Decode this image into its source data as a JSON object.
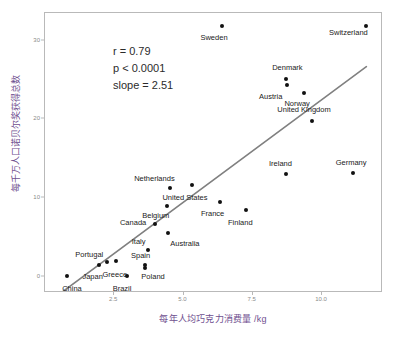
{
  "chart_data": {
    "type": "scatter",
    "title": "",
    "xlabel": "每年人均巧克力消费量 /kg",
    "ylabel": "每千万人口诺贝尔奖获得总数",
    "xlim": [
      0,
      12.2
    ],
    "ylim": [
      -2.0,
      33.5
    ],
    "xticks": [
      "2.5",
      "5.0",
      "7.5",
      "10.0"
    ],
    "xtick_values": [
      2.5,
      5.0,
      7.5,
      10.0
    ],
    "yticks": [
      "0",
      "10",
      "20",
      "30"
    ],
    "ytick_values": [
      0,
      10,
      20,
      30
    ],
    "grid": false,
    "legend": "none",
    "annotations": {
      "r": "r = 0.79",
      "p": "p < 0.0001",
      "slope": "slope = 2.51"
    },
    "stats": {
      "correlation": 0.79,
      "p_value": "< 0.0001",
      "slope": 2.51
    },
    "fit_line": {
      "type": "linear",
      "color": "#808080",
      "x_start": 0.65,
      "y_start": -1.8,
      "x_end": 11.6,
      "y_end": 26.7
    },
    "point_color": "#111111",
    "points": [
      {
        "name": "China",
        "x": 0.8,
        "y": 0.1,
        "lx": 0.62,
        "ly": -1.35,
        "anchor": "left"
      },
      {
        "name": "Japan",
        "x": 1.95,
        "y": 1.6,
        "lx": 1.72,
        "ly": 0.1,
        "anchor": "center"
      },
      {
        "name": "Portugal",
        "x": 2.22,
        "y": 1.95,
        "lx": 1.6,
        "ly": 2.95,
        "anchor": "center"
      },
      {
        "name": "Brazil",
        "x": 2.95,
        "y": 0.15,
        "lx": 2.78,
        "ly": -1.35,
        "anchor": "center"
      },
      {
        "name": "Greece",
        "x": 2.55,
        "y": 2.05,
        "lx": 2.52,
        "ly": 0.45,
        "anchor": "center"
      },
      {
        "name": "Spain",
        "x": 3.6,
        "y": 1.6,
        "lx": 3.45,
        "ly": 2.85,
        "anchor": "center"
      },
      {
        "name": "Poland",
        "x": 3.62,
        "y": 1.2,
        "lx": 3.9,
        "ly": 0.1,
        "anchor": "center"
      },
      {
        "name": "Italy",
        "x": 3.7,
        "y": 3.45,
        "lx": 3.38,
        "ly": 4.55,
        "anchor": "center"
      },
      {
        "name": "Australia",
        "x": 4.45,
        "y": 5.6,
        "lx": 5.05,
        "ly": 4.3,
        "anchor": "center"
      },
      {
        "name": "Canada",
        "x": 3.98,
        "y": 6.8,
        "lx": 3.18,
        "ly": 7.05,
        "anchor": "center"
      },
      {
        "name": "Belgium",
        "x": 4.4,
        "y": 9.05,
        "lx": 4.0,
        "ly": 7.95,
        "anchor": "center"
      },
      {
        "name": "Netherlands",
        "x": 4.5,
        "y": 11.25,
        "lx": 3.95,
        "ly": 12.6,
        "anchor": "center"
      },
      {
        "name": "United States",
        "x": 5.3,
        "y": 11.75,
        "lx": 5.05,
        "ly": 10.2,
        "anchor": "center"
      },
      {
        "name": "France",
        "x": 6.3,
        "y": 9.55,
        "lx": 6.05,
        "ly": 8.2,
        "anchor": "center"
      },
      {
        "name": "Finland",
        "x": 7.25,
        "y": 8.5,
        "lx": 7.05,
        "ly": 7.0,
        "anchor": "center"
      },
      {
        "name": "Ireland",
        "x": 8.7,
        "y": 13.15,
        "lx": 8.5,
        "ly": 14.45,
        "anchor": "center"
      },
      {
        "name": "Germany",
        "x": 11.1,
        "y": 13.2,
        "lx": 11.05,
        "ly": 14.55,
        "anchor": "center"
      },
      {
        "name": "United Kingdom",
        "x": 9.65,
        "y": 19.8,
        "lx": 9.35,
        "ly": 21.3,
        "anchor": "center"
      },
      {
        "name": "Norway",
        "x": 9.35,
        "y": 23.4,
        "lx": 9.1,
        "ly": 22.1,
        "anchor": "center"
      },
      {
        "name": "Austria",
        "x": 8.75,
        "y": 24.4,
        "lx": 8.15,
        "ly": 22.95,
        "anchor": "center"
      },
      {
        "name": "Denmark",
        "x": 8.7,
        "y": 25.15,
        "lx": 8.75,
        "ly": 26.6,
        "anchor": "center"
      },
      {
        "name": "Sweden",
        "x": 6.4,
        "y": 31.9,
        "lx": 6.1,
        "ly": 30.4,
        "anchor": "center"
      },
      {
        "name": "Switzerland",
        "x": 11.6,
        "y": 31.9,
        "lx": 10.95,
        "ly": 31.05,
        "anchor": "center"
      }
    ]
  }
}
